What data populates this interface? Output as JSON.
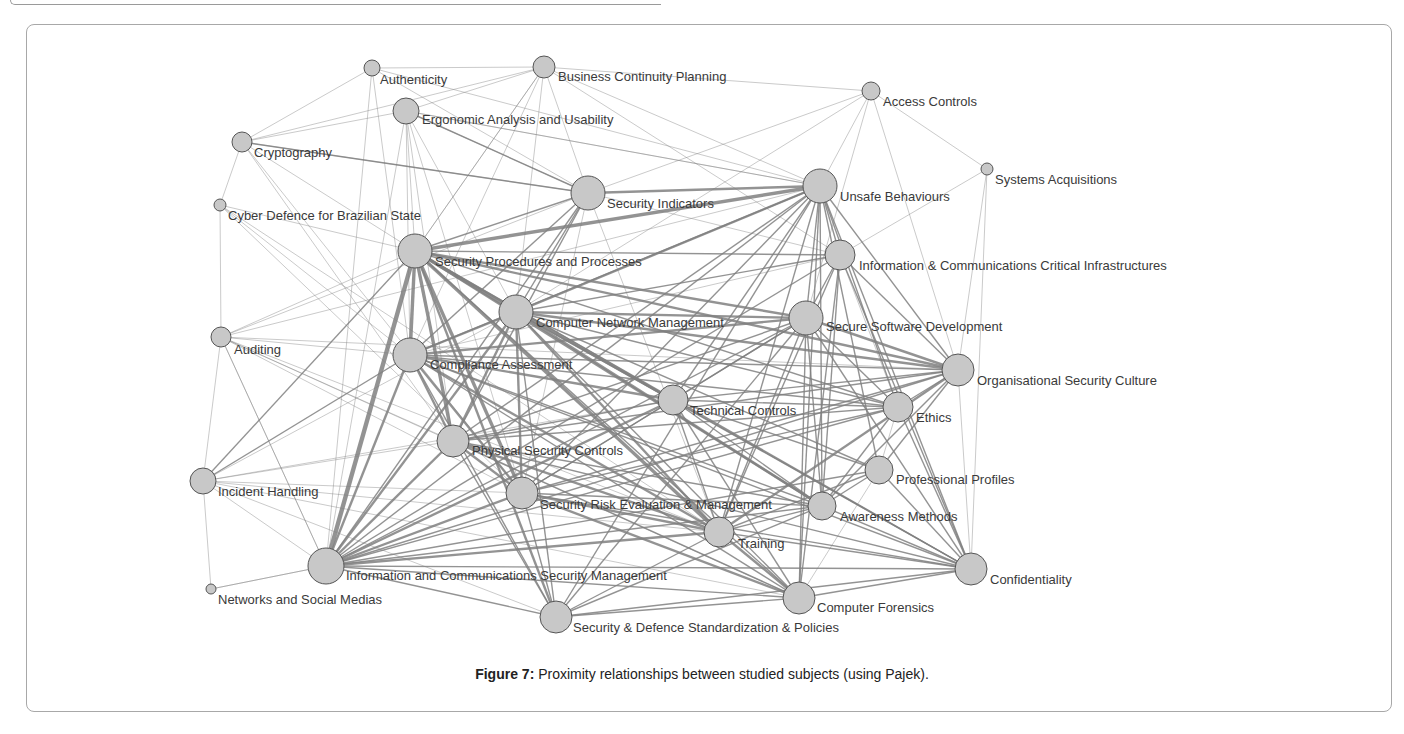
{
  "figure": {
    "caption_label": "Figure 7:",
    "caption_text": " Proximity relationships between studied subjects (using Pajek).",
    "node_fill": "#c8c8c8",
    "node_stroke": "#555555",
    "edge_color": "#808080",
    "label_color": "#3a3a3a"
  },
  "nodes": [
    {
      "id": "authenticity",
      "label": "Authenticity",
      "x": 372,
      "y": 68,
      "r": 8,
      "lx": 380,
      "ly": 84
    },
    {
      "id": "bcp",
      "label": "Business Continuity Planning",
      "x": 544,
      "y": 67,
      "r": 11,
      "lx": 558,
      "ly": 81
    },
    {
      "id": "ergonomic",
      "label": "Ergonomic Analysis and Usability",
      "x": 406,
      "y": 111,
      "r": 13,
      "lx": 422,
      "ly": 124
    },
    {
      "id": "access",
      "label": "Access Controls",
      "x": 871,
      "y": 91,
      "r": 9,
      "lx": 883,
      "ly": 106
    },
    {
      "id": "crypto",
      "label": "Cryptography",
      "x": 242,
      "y": 142,
      "r": 10,
      "lx": 254,
      "ly": 157
    },
    {
      "id": "sysacq",
      "label": "Systems Acquisitions",
      "x": 987,
      "y": 169,
      "r": 6,
      "lx": 995,
      "ly": 184
    },
    {
      "id": "secind",
      "label": "Security Indicators",
      "x": 588,
      "y": 193,
      "r": 17,
      "lx": 607,
      "ly": 208
    },
    {
      "id": "unsafe",
      "label": "Unsafe Behaviours",
      "x": 820,
      "y": 186,
      "r": 17,
      "lx": 840,
      "ly": 201
    },
    {
      "id": "cyberdef",
      "label": "Cyber Defence for Brazilian State",
      "x": 220,
      "y": 205,
      "r": 6,
      "lx": 228,
      "ly": 220
    },
    {
      "id": "secproc",
      "label": "Security Procedures and Processes",
      "x": 415,
      "y": 251,
      "r": 17,
      "lx": 435,
      "ly": 266
    },
    {
      "id": "iccritical",
      "label": "Information & Communications Critical Infrastructures",
      "x": 840,
      "y": 255,
      "r": 15,
      "lx": 859,
      "ly": 270
    },
    {
      "id": "cnm",
      "label": "Computer Network Management",
      "x": 516,
      "y": 312,
      "r": 17,
      "lx": 536,
      "ly": 327
    },
    {
      "id": "securesw",
      "label": "Secure Software Development",
      "x": 806,
      "y": 318,
      "r": 17,
      "lx": 826,
      "ly": 331
    },
    {
      "id": "auditing",
      "label": "Auditing",
      "x": 221,
      "y": 337,
      "r": 10,
      "lx": 234,
      "ly": 354
    },
    {
      "id": "compliance",
      "label": "Compliance Assessment",
      "x": 410,
      "y": 355,
      "r": 17,
      "lx": 430,
      "ly": 369
    },
    {
      "id": "orgculture",
      "label": "Organisational Security Culture",
      "x": 958,
      "y": 370,
      "r": 16,
      "lx": 977,
      "ly": 385
    },
    {
      "id": "techctrl",
      "label": "Technical Controls",
      "x": 673,
      "y": 400,
      "r": 15,
      "lx": 690,
      "ly": 415
    },
    {
      "id": "ethics",
      "label": "Ethics",
      "x": 898,
      "y": 407,
      "r": 15,
      "lx": 916,
      "ly": 422
    },
    {
      "id": "physical",
      "label": "Physical Security Controls",
      "x": 453,
      "y": 441,
      "r": 16,
      "lx": 472,
      "ly": 455
    },
    {
      "id": "profprof",
      "label": "Professional Profiles",
      "x": 879,
      "y": 470,
      "r": 14,
      "lx": 896,
      "ly": 484
    },
    {
      "id": "incident",
      "label": "Incident Handling",
      "x": 203,
      "y": 481,
      "r": 13,
      "lx": 218,
      "ly": 496
    },
    {
      "id": "riskeval",
      "label": "Security Risk Evaluation & Management",
      "x": 522,
      "y": 493,
      "r": 16,
      "lx": 540,
      "ly": 509
    },
    {
      "id": "awareness",
      "label": "Awareness Methods",
      "x": 822,
      "y": 506,
      "r": 14,
      "lx": 840,
      "ly": 521
    },
    {
      "id": "training",
      "label": "Training",
      "x": 719,
      "y": 532,
      "r": 15,
      "lx": 738,
      "ly": 548
    },
    {
      "id": "icsm",
      "label": "Information and Communications Security Management",
      "x": 326,
      "y": 566,
      "r": 18,
      "lx": 346,
      "ly": 580
    },
    {
      "id": "confidentiality",
      "label": "Confidentiality",
      "x": 971,
      "y": 569,
      "r": 16,
      "lx": 990,
      "ly": 584
    },
    {
      "id": "networks",
      "label": "Networks and Social Medias",
      "x": 211,
      "y": 589,
      "r": 5,
      "lx": 218,
      "ly": 604
    },
    {
      "id": "forensics",
      "label": "Computer Forensics",
      "x": 799,
      "y": 598,
      "r": 16,
      "lx": 817,
      "ly": 612
    },
    {
      "id": "standards",
      "label": "Security & Defence Standardization & Policies",
      "x": 556,
      "y": 617,
      "r": 16,
      "lx": 573,
      "ly": 632
    }
  ],
  "edges": [
    [
      "secproc",
      "icsm",
      5
    ],
    [
      "secproc",
      "compliance",
      4
    ],
    [
      "secproc",
      "cnm",
      4
    ],
    [
      "secproc",
      "physical",
      4
    ],
    [
      "secproc",
      "riskeval",
      4
    ],
    [
      "secproc",
      "training",
      4
    ],
    [
      "secproc",
      "techctrl",
      3
    ],
    [
      "secproc",
      "unsafe",
      4
    ],
    [
      "secproc",
      "securesw",
      3
    ],
    [
      "secproc",
      "orgculture",
      3
    ],
    [
      "secproc",
      "secind",
      2
    ],
    [
      "secproc",
      "awareness",
      3
    ],
    [
      "secproc",
      "standards",
      3
    ],
    [
      "secproc",
      "confidentiality",
      2
    ],
    [
      "secproc",
      "forensics",
      2
    ],
    [
      "secproc",
      "ethics",
      2
    ],
    [
      "secproc",
      "iccritical",
      2
    ],
    [
      "secproc",
      "incident",
      2
    ],
    [
      "secproc",
      "auditing",
      1
    ],
    [
      "secproc",
      "crypto",
      1
    ],
    [
      "secproc",
      "ergonomic",
      1
    ],
    [
      "secproc",
      "cyberdef",
      1
    ],
    [
      "secproc",
      "bcp",
      1
    ],
    [
      "cnm",
      "compliance",
      3
    ],
    [
      "cnm",
      "physical",
      3
    ],
    [
      "cnm",
      "riskeval",
      3
    ],
    [
      "cnm",
      "techctrl",
      3
    ],
    [
      "cnm",
      "unsafe",
      3
    ],
    [
      "cnm",
      "securesw",
      3
    ],
    [
      "cnm",
      "orgculture",
      3
    ],
    [
      "cnm",
      "icsm",
      3
    ],
    [
      "cnm",
      "training",
      3
    ],
    [
      "cnm",
      "awareness",
      3
    ],
    [
      "cnm",
      "forensics",
      2
    ],
    [
      "cnm",
      "confidentiality",
      2
    ],
    [
      "cnm",
      "ethics",
      2
    ],
    [
      "cnm",
      "profprof",
      2
    ],
    [
      "cnm",
      "standards",
      2
    ],
    [
      "cnm",
      "iccritical",
      2
    ],
    [
      "cnm",
      "secind",
      2
    ],
    [
      "icsm",
      "compliance",
      3
    ],
    [
      "icsm",
      "physical",
      3
    ],
    [
      "icsm",
      "riskeval",
      3
    ],
    [
      "icsm",
      "training",
      3
    ],
    [
      "icsm",
      "techctrl",
      3
    ],
    [
      "icsm",
      "unsafe",
      2
    ],
    [
      "icsm",
      "securesw",
      2
    ],
    [
      "icsm",
      "awareness",
      2
    ],
    [
      "icsm",
      "standards",
      2
    ],
    [
      "icsm",
      "forensics",
      2
    ],
    [
      "icsm",
      "confidentiality",
      2
    ],
    [
      "icsm",
      "orgculture",
      2
    ],
    [
      "icsm",
      "ethics",
      2
    ],
    [
      "icsm",
      "profprof",
      2
    ],
    [
      "icsm",
      "incident",
      1
    ],
    [
      "icsm",
      "networks",
      1
    ],
    [
      "icsm",
      "auditing",
      1
    ],
    [
      "icsm",
      "iccritical",
      2
    ],
    [
      "icsm",
      "secind",
      2
    ],
    [
      "unsafe",
      "secind",
      3
    ],
    [
      "unsafe",
      "compliance",
      2
    ],
    [
      "unsafe",
      "physical",
      2
    ],
    [
      "unsafe",
      "riskeval",
      2
    ],
    [
      "unsafe",
      "training",
      2
    ],
    [
      "unsafe",
      "awareness",
      2
    ],
    [
      "unsafe",
      "forensics",
      2
    ],
    [
      "unsafe",
      "standards",
      2
    ],
    [
      "unsafe",
      "techctrl",
      2
    ],
    [
      "unsafe",
      "orgculture",
      2
    ],
    [
      "unsafe",
      "ethics",
      2
    ],
    [
      "unsafe",
      "iccritical",
      2
    ],
    [
      "unsafe",
      "securesw",
      2
    ],
    [
      "unsafe",
      "access",
      1
    ],
    [
      "unsafe",
      "bcp",
      1
    ],
    [
      "unsafe",
      "ergonomic",
      1
    ],
    [
      "unsafe",
      "confidentiality",
      2
    ],
    [
      "unsafe",
      "profprof",
      2
    ],
    [
      "securesw",
      "compliance",
      3
    ],
    [
      "securesw",
      "physical",
      2
    ],
    [
      "securesw",
      "riskeval",
      2
    ],
    [
      "securesw",
      "training",
      2
    ],
    [
      "securesw",
      "orgculture",
      3
    ],
    [
      "securesw",
      "ethics",
      2
    ],
    [
      "securesw",
      "techctrl",
      2
    ],
    [
      "securesw",
      "awareness",
      2
    ],
    [
      "securesw",
      "confidentiality",
      2
    ],
    [
      "securesw",
      "forensics",
      2
    ],
    [
      "securesw",
      "standards",
      2
    ],
    [
      "securesw",
      "iccritical",
      2
    ],
    [
      "orgculture",
      "compliance",
      2
    ],
    [
      "orgculture",
      "physical",
      2
    ],
    [
      "orgculture",
      "riskeval",
      2
    ],
    [
      "orgculture",
      "training",
      3
    ],
    [
      "orgculture",
      "ethics",
      2
    ],
    [
      "orgculture",
      "techctrl",
      2
    ],
    [
      "orgculture",
      "awareness",
      2
    ],
    [
      "orgculture",
      "confidentiality",
      1
    ],
    [
      "orgculture",
      "profprof",
      2
    ],
    [
      "orgculture",
      "iccritical",
      2
    ],
    [
      "orgculture",
      "access",
      1
    ],
    [
      "orgculture",
      "sysacq",
      1
    ],
    [
      "compliance",
      "physical",
      3
    ],
    [
      "compliance",
      "riskeval",
      3
    ],
    [
      "compliance",
      "training",
      3
    ],
    [
      "compliance",
      "techctrl",
      3
    ],
    [
      "compliance",
      "standards",
      2
    ],
    [
      "compliance",
      "forensics",
      2
    ],
    [
      "compliance",
      "awareness",
      2
    ],
    [
      "compliance",
      "confidentiality",
      2
    ],
    [
      "compliance",
      "ethics",
      2
    ],
    [
      "physical",
      "riskeval",
      3
    ],
    [
      "physical",
      "training",
      3
    ],
    [
      "physical",
      "techctrl",
      2
    ],
    [
      "physical",
      "standards",
      2
    ],
    [
      "physical",
      "forensics",
      2
    ],
    [
      "physical",
      "awareness",
      2
    ],
    [
      "physical",
      "confidentiality",
      2
    ],
    [
      "physical",
      "ethics",
      2
    ],
    [
      "riskeval",
      "training",
      3
    ],
    [
      "riskeval",
      "techctrl",
      2
    ],
    [
      "riskeval",
      "standards",
      2
    ],
    [
      "riskeval",
      "forensics",
      3
    ],
    [
      "riskeval",
      "awareness",
      2
    ],
    [
      "riskeval",
      "confidentiality",
      2
    ],
    [
      "riskeval",
      "ethics",
      2
    ],
    [
      "training",
      "standards",
      2
    ],
    [
      "training",
      "forensics",
      3
    ],
    [
      "training",
      "awareness",
      2
    ],
    [
      "training",
      "confidentiality",
      2
    ],
    [
      "training",
      "techctrl",
      2
    ],
    [
      "techctrl",
      "forensics",
      2
    ],
    [
      "techctrl",
      "confidentiality",
      2
    ],
    [
      "techctrl",
      "awareness",
      2
    ],
    [
      "techctrl",
      "ethics",
      2
    ],
    [
      "techctrl",
      "profprof",
      2
    ],
    [
      "standards",
      "forensics",
      2
    ],
    [
      "standards",
      "confidentiality",
      2
    ],
    [
      "standards",
      "awareness",
      2
    ],
    [
      "forensics",
      "confidentiality",
      2
    ],
    [
      "awareness",
      "confidentiality",
      2
    ],
    [
      "ethics",
      "confidentiality",
      2
    ],
    [
      "profprof",
      "confidentiality",
      2
    ],
    [
      "ethics",
      "awareness",
      2
    ],
    [
      "secind",
      "compliance",
      2
    ],
    [
      "secind",
      "physical",
      2
    ],
    [
      "secind",
      "riskeval",
      1
    ],
    [
      "secind",
      "training",
      1
    ],
    [
      "secind",
      "iccritical",
      1
    ],
    [
      "secind",
      "crypto",
      1
    ],
    [
      "secind",
      "ergonomic",
      1
    ],
    [
      "secind",
      "bcp",
      1
    ],
    [
      "secind",
      "authenticity",
      1
    ],
    [
      "secind",
      "auditing",
      1
    ],
    [
      "iccritical",
      "training",
      2
    ],
    [
      "iccritical",
      "awareness",
      2
    ],
    [
      "iccritical",
      "forensics",
      2
    ],
    [
      "iccritical",
      "confidentiality",
      2
    ],
    [
      "iccritical",
      "sysacq",
      1
    ],
    [
      "iccritical",
      "ethics",
      1
    ],
    [
      "iccritical",
      "compliance",
      1
    ],
    [
      "ergonomic",
      "bcp",
      1
    ],
    [
      "ergonomic",
      "crypto",
      1
    ],
    [
      "ergonomic",
      "icsm",
      1
    ],
    [
      "ergonomic",
      "compliance",
      1
    ],
    [
      "ergonomic",
      "cnm",
      1
    ],
    [
      "ergonomic",
      "physical",
      1
    ],
    [
      "ergonomic",
      "riskeval",
      1
    ],
    [
      "ergonomic",
      "secind",
      2
    ],
    [
      "ergonomic",
      "unsafe",
      1
    ],
    [
      "authenticity",
      "bcp",
      1
    ],
    [
      "authenticity",
      "crypto",
      1
    ],
    [
      "authenticity",
      "compliance",
      1
    ],
    [
      "authenticity",
      "icsm",
      1
    ],
    [
      "authenticity",
      "unsafe",
      1
    ],
    [
      "bcp",
      "access",
      1
    ],
    [
      "bcp",
      "cnm",
      1
    ],
    [
      "bcp",
      "secproc",
      1
    ],
    [
      "bcp",
      "compliance",
      1
    ],
    [
      "bcp",
      "iccritical",
      1
    ],
    [
      "bcp",
      "crypto",
      1
    ],
    [
      "crypto",
      "cyberdef",
      1
    ],
    [
      "crypto",
      "riskeval",
      1
    ],
    [
      "crypto",
      "physical",
      1
    ],
    [
      "crypto",
      "secind",
      2
    ],
    [
      "cyberdef",
      "auditing",
      1
    ],
    [
      "cyberdef",
      "compliance",
      1
    ],
    [
      "cyberdef",
      "riskeval",
      1
    ],
    [
      "cyberdef",
      "training",
      1
    ],
    [
      "access",
      "secind",
      1
    ],
    [
      "access",
      "sysacq",
      1
    ],
    [
      "access",
      "cnm",
      1
    ],
    [
      "access",
      "securesw",
      1
    ],
    [
      "sysacq",
      "confidentiality",
      1
    ],
    [
      "auditing",
      "incident",
      1
    ],
    [
      "auditing",
      "compliance",
      1
    ],
    [
      "auditing",
      "riskeval",
      1
    ],
    [
      "auditing",
      "icsm",
      1
    ],
    [
      "auditing",
      "physical",
      1
    ],
    [
      "auditing",
      "training",
      1
    ],
    [
      "auditing",
      "forensics",
      1
    ],
    [
      "auditing",
      "unsafe",
      1
    ],
    [
      "auditing",
      "orgculture",
      1
    ],
    [
      "incident",
      "compliance",
      2
    ],
    [
      "incident",
      "physical",
      1
    ],
    [
      "incident",
      "riskeval",
      1
    ],
    [
      "incident",
      "training",
      1
    ],
    [
      "incident",
      "techctrl",
      1
    ],
    [
      "incident",
      "cnm",
      1
    ],
    [
      "incident",
      "networks",
      1
    ],
    [
      "incident",
      "forensics",
      1
    ],
    [
      "incident",
      "standards",
      1
    ],
    [
      "networks",
      "icsm",
      1
    ],
    [
      "profprof",
      "awareness",
      2
    ],
    [
      "profprof",
      "training",
      2
    ],
    [
      "profprof",
      "ethics",
      1
    ],
    [
      "profprof",
      "forensics",
      1
    ]
  ]
}
